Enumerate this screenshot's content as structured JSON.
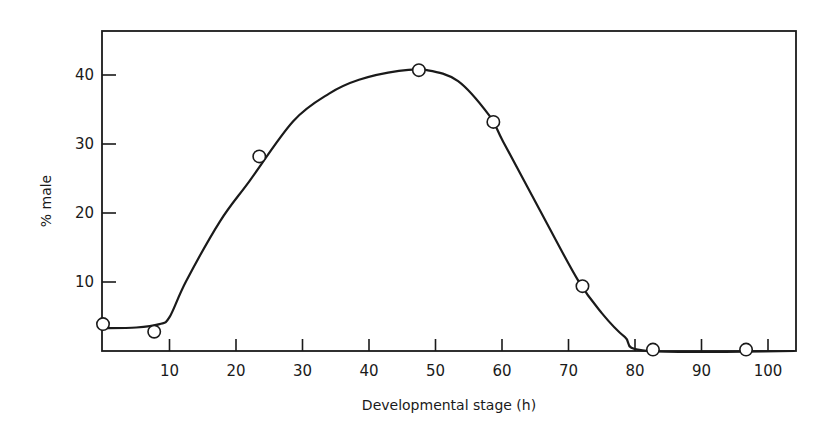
{
  "chart_data": {
    "type": "line",
    "title": "",
    "xlabel": "Developmental stage (h)",
    "ylabel": "% male",
    "xlim": [
      0,
      104
    ],
    "ylim": [
      0,
      46
    ],
    "grid": false,
    "legend": null,
    "x_ticks": [
      10,
      20,
      30,
      40,
      50,
      60,
      70,
      80,
      90,
      100
    ],
    "y_ticks": [
      10,
      20,
      30,
      40
    ],
    "series": [
      {
        "name": "observed",
        "style": "open-circle markers",
        "x": [
          0,
          7.7,
          23.5,
          47.5,
          58.7,
          72.1,
          82.7,
          96.7
        ],
        "y": [
          3.9,
          2.8,
          28.2,
          40.7,
          33.2,
          9.4,
          0.2,
          0.2
        ]
      },
      {
        "name": "fitted curve",
        "style": "smooth solid line",
        "x": [
          0,
          5,
          8.5,
          10,
          12.5,
          17.6,
          22,
          28.6,
          34,
          38.5,
          44.5,
          48.7,
          53.4,
          58.1,
          60.2,
          65.7,
          71.4,
          75,
          78.5,
          82
        ],
        "y": [
          3.3,
          3.4,
          3.9,
          4.9,
          10.1,
          18.8,
          24.6,
          33.3,
          37.3,
          39.3,
          40.6,
          40.7,
          39.1,
          34.1,
          30.3,
          20.4,
          10.3,
          5.5,
          2.0,
          0
        ]
      }
    ]
  },
  "axes": {
    "x_title": "Developmental stage (h)",
    "y_title": "% male",
    "x_tick_labels": [
      "10",
      "20",
      "30",
      "40",
      "50",
      "60",
      "70",
      "80",
      "90",
      "100"
    ],
    "y_tick_labels": [
      "10",
      "20",
      "30",
      "40"
    ]
  },
  "colors": {
    "ink": "#1a1a1a",
    "background": "#ffffff",
    "marker_fill": "#ffffff"
  }
}
